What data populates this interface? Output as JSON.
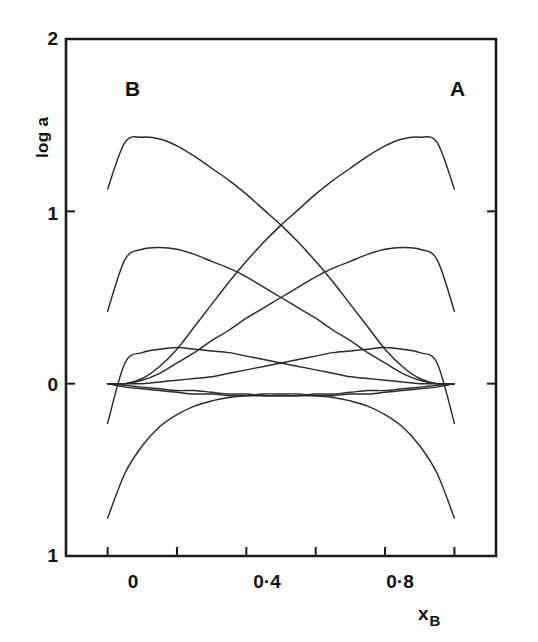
{
  "figure": {
    "background_color": "#ffffff",
    "ink_color": "#1a1a1a",
    "curve_color": "#2b2b2b"
  },
  "axes": {
    "y_title": "log a",
    "x_title_main": "x",
    "x_title_sub": "B",
    "y_ticks": [
      "2",
      "1",
      "0",
      "1"
    ],
    "x_ticks": [
      "0",
      "0·4",
      "0·8"
    ]
  },
  "annotations": {
    "left_component": "B",
    "right_component": "A"
  },
  "chart_data": {
    "type": "line",
    "title": "",
    "subtitle": "",
    "xlabel": "x_B",
    "ylabel": "log a",
    "xlim": [
      -0.12,
      1.12
    ],
    "ylim": [
      -1,
      2
    ],
    "x_tick_values": [
      0,
      0.2,
      0.4,
      0.6,
      0.8,
      1.0
    ],
    "x_labelled_ticks": [
      0,
      0.4,
      0.8
    ],
    "y_tick_values": [
      -1,
      0,
      1,
      2
    ],
    "y_tick_labels": [
      "1",
      "0",
      "1",
      "2"
    ],
    "grid": false,
    "legend": null,
    "annotations": [
      {
        "text": "B",
        "x": 0.02,
        "y": 1.72
      },
      {
        "text": "A",
        "x": 0.98,
        "y": 1.72
      }
    ],
    "x": [
      0.0,
      0.05,
      0.1,
      0.15,
      0.2,
      0.25,
      0.3,
      0.35,
      0.4,
      0.45,
      0.5,
      0.55,
      0.6,
      0.65,
      0.7,
      0.75,
      0.8,
      0.85,
      0.9,
      0.95,
      1.0
    ],
    "series": [
      {
        "name": "activity of B, strong positive deviation",
        "component": "B",
        "values": [
          1.13,
          1.4,
          1.43,
          1.42,
          1.38,
          1.32,
          1.25,
          1.18,
          1.1,
          1.01,
          0.92,
          0.82,
          0.71,
          0.59,
          0.46,
          0.33,
          0.2,
          0.1,
          0.03,
          0.0,
          0.0
        ]
      },
      {
        "name": "activity of A, strong positive deviation",
        "component": "A",
        "values": [
          0.0,
          0.0,
          0.03,
          0.1,
          0.2,
          0.33,
          0.46,
          0.59,
          0.71,
          0.82,
          0.92,
          1.01,
          1.1,
          1.18,
          1.25,
          1.32,
          1.38,
          1.42,
          1.43,
          1.4,
          1.13
        ]
      },
      {
        "name": "activity of B, moderate positive deviation",
        "component": "B",
        "values": [
          0.42,
          0.72,
          0.78,
          0.79,
          0.78,
          0.75,
          0.71,
          0.67,
          0.62,
          0.56,
          0.5,
          0.44,
          0.38,
          0.31,
          0.25,
          0.18,
          0.12,
          0.06,
          0.02,
          0.0,
          0.0
        ]
      },
      {
        "name": "activity of A, moderate positive deviation",
        "component": "A",
        "values": [
          0.0,
          0.0,
          0.02,
          0.06,
          0.12,
          0.18,
          0.25,
          0.31,
          0.38,
          0.44,
          0.5,
          0.56,
          0.62,
          0.67,
          0.71,
          0.75,
          0.78,
          0.79,
          0.78,
          0.72,
          0.42
        ]
      },
      {
        "name": "activity of B, weak positive deviation",
        "component": "B",
        "values": [
          -0.23,
          0.12,
          0.18,
          0.2,
          0.21,
          0.2,
          0.19,
          0.18,
          0.16,
          0.14,
          0.12,
          0.1,
          0.08,
          0.06,
          0.04,
          0.03,
          0.02,
          0.01,
          0.0,
          0.0,
          0.0
        ]
      },
      {
        "name": "activity of A, weak positive deviation",
        "component": "A",
        "values": [
          0.0,
          0.0,
          0.0,
          0.01,
          0.02,
          0.03,
          0.04,
          0.06,
          0.08,
          0.1,
          0.12,
          0.14,
          0.16,
          0.18,
          0.19,
          0.2,
          0.21,
          0.2,
          0.18,
          0.12,
          -0.23
        ]
      },
      {
        "name": "activity of B, slight negative deviation",
        "component": "B",
        "values": [
          0.0,
          -0.02,
          -0.03,
          -0.04,
          -0.05,
          -0.06,
          -0.06,
          -0.07,
          -0.07,
          -0.07,
          -0.07,
          -0.07,
          -0.06,
          -0.06,
          -0.05,
          -0.04,
          -0.04,
          -0.03,
          -0.02,
          -0.01,
          0.0
        ]
      },
      {
        "name": "activity of A, slight negative deviation",
        "component": "A",
        "values": [
          0.0,
          -0.01,
          -0.02,
          -0.03,
          -0.04,
          -0.04,
          -0.05,
          -0.06,
          -0.06,
          -0.07,
          -0.07,
          -0.07,
          -0.07,
          -0.07,
          -0.06,
          -0.06,
          -0.05,
          -0.04,
          -0.03,
          -0.02,
          0.0
        ]
      },
      {
        "name": "activity, strong negative deviation",
        "component": "both",
        "values": [
          -0.78,
          -0.52,
          -0.36,
          -0.25,
          -0.18,
          -0.13,
          -0.1,
          -0.08,
          -0.07,
          -0.06,
          -0.06,
          -0.06,
          -0.07,
          -0.08,
          -0.1,
          -0.13,
          -0.18,
          -0.25,
          -0.36,
          -0.52,
          -0.78
        ]
      }
    ]
  }
}
